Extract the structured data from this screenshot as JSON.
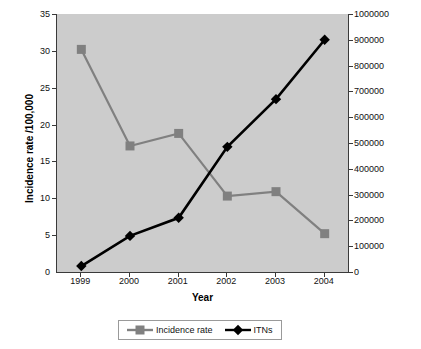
{
  "chart_data": {
    "type": "line",
    "title": "",
    "xlabel": "Year",
    "ylabel": "Incidence rate /100,000",
    "y2label": "Cumulative ITNs",
    "categories": [
      "1999",
      "2000",
      "2001",
      "2002",
      "2003",
      "2004"
    ],
    "x": [
      1999,
      2000,
      2001,
      2002,
      2003,
      2004
    ],
    "ylim": [
      0,
      35
    ],
    "y2lim": [
      0,
      1000000
    ],
    "yticks": [
      "0",
      "5",
      "10",
      "15",
      "20",
      "25",
      "30",
      "35"
    ],
    "y2ticks": [
      "0",
      "100000",
      "200000",
      "300000",
      "400000",
      "500000",
      "600000",
      "700000",
      "800000",
      "900000",
      "1000000"
    ],
    "grid": false,
    "legend_position": "bottom",
    "plot_background": "#cccccc",
    "series": [
      {
        "name": "Incidence rate",
        "axis": "left",
        "color": "#808080",
        "marker": "square",
        "values": [
          30.2,
          17.1,
          18.8,
          10.3,
          10.9,
          5.2
        ]
      },
      {
        "name": "ITNs",
        "axis": "right",
        "color": "#000000",
        "marker": "diamond",
        "values": [
          23000,
          140000,
          210000,
          485000,
          670000,
          900000
        ]
      }
    ]
  },
  "axes": {
    "x_title": "Year",
    "y_left_title": "Incidence rate /100,000",
    "y_right_title": "Cumulative ITNs"
  },
  "legend": {
    "items": [
      {
        "label": "Incidence rate",
        "color": "#808080",
        "marker": "square"
      },
      {
        "label": "ITNs",
        "color": "#000000",
        "marker": "diamond"
      }
    ]
  }
}
